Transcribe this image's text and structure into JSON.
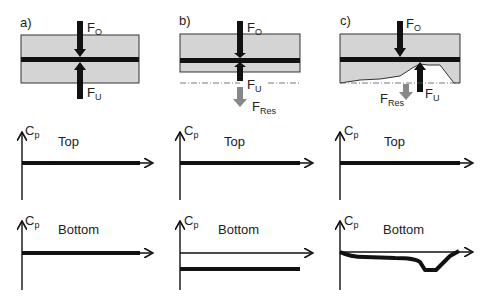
{
  "panels": [
    {
      "id": "a",
      "label": "a)",
      "force_top": "F",
      "force_top_sub": "O",
      "force_bottom": "F",
      "force_bottom_sub": "U"
    },
    {
      "id": "b",
      "label": "b)",
      "force_top": "F",
      "force_top_sub": "O",
      "force_bottom": "F",
      "force_bottom_sub": "U",
      "force_res": "F",
      "force_res_sub": "Res"
    },
    {
      "id": "c",
      "label": "c)",
      "force_top": "F",
      "force_top_sub": "O",
      "force_bottom": "F",
      "force_bottom_sub": "U",
      "force_res": "F",
      "force_res_sub": "Res"
    }
  ],
  "plots": {
    "axis_label": "C",
    "axis_label_sub": "p",
    "top_title": "Top",
    "bottom_title": "Bottom"
  },
  "colors": {
    "plate": "#d4d4d4",
    "line": "#111111",
    "resultant": "#888888"
  }
}
